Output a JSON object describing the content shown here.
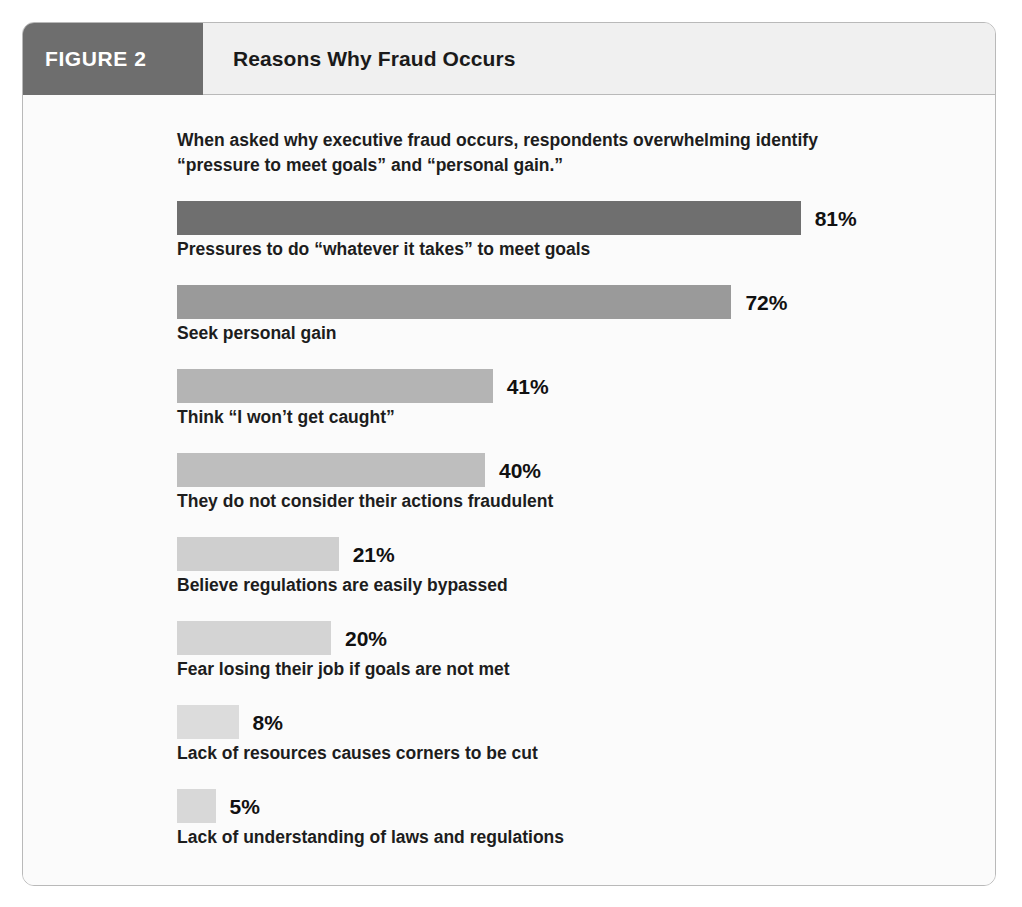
{
  "figure": {
    "badge_label": "FIGURE 2",
    "title": "Reasons Why Fraud Occurs",
    "intro": "When asked why executive fraud occurs, respondents overwhelming identify “pressure to meet goals” and “personal gain.”"
  },
  "colors": {
    "badge_background": "#6e6e6e",
    "title_background": "#f0f0f0",
    "frame_border": "#b9b9b9",
    "body_background": "#fbfbfb",
    "text": "#1d1d1d"
  },
  "chart_data": {
    "type": "bar",
    "orientation": "horizontal",
    "title": "Reasons Why Fraud Occurs",
    "subtitle": "When asked why executive fraud occurs, respondents overwhelming identify “pressure to meet goals” and “personal gain.”",
    "xlabel": "",
    "ylabel": "",
    "xlim": [
      0,
      100
    ],
    "grid": false,
    "legend": false,
    "value_suffix": "%",
    "categories": [
      "Pressures to do “whatever it takes” to meet goals",
      "Seek personal gain",
      "Think “I won’t get caught”",
      "They do not consider their actions fraudulent",
      "Believe regulations are easily bypassed",
      "Fear losing their job if goals are not met",
      "Lack of resources causes corners to be cut",
      "Lack of understanding of laws and regulations"
    ],
    "values": [
      81,
      72,
      41,
      40,
      21,
      20,
      8,
      5
    ],
    "value_labels": [
      "81%",
      "72%",
      "41%",
      "40%",
      "21%",
      "20%",
      "8%",
      "5%"
    ],
    "bar_colors": [
      "#6f6f6f",
      "#9a9a9a",
      "#b4b4b4",
      "#bebebe",
      "#cfcfcf",
      "#d4d4d4",
      "#dcdcdc",
      "#d8d8d8"
    ]
  }
}
